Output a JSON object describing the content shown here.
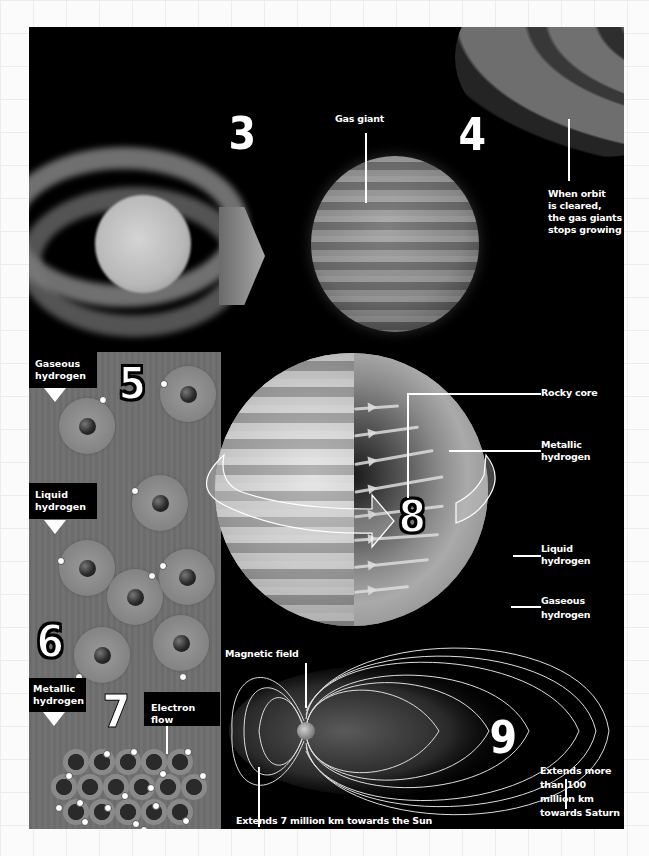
{
  "colors": {
    "panel_background": "#000000",
    "page_background": "#fbfbfb",
    "grid_line": "#ececec",
    "text": "#ffffff",
    "gray_panel": "#6f6f6f"
  },
  "stages": {
    "s3": {
      "number": "3"
    },
    "s4": {
      "number": "4",
      "gas_giant_label": "Gas giant",
      "orbit_note_lines": [
        "When orbit",
        "is cleared,",
        "the gas giants",
        "stops growing"
      ]
    },
    "s5": {
      "number": "5",
      "label_lines": [
        "Gaseous",
        "hydrogen"
      ]
    },
    "s6": {
      "number": "6",
      "label_lines": [
        "Liquid",
        "hydrogen"
      ]
    },
    "s7": {
      "number": "7",
      "label_lines": [
        "Metallic",
        "hydrogen"
      ],
      "electron_flow_label": "Electron flow"
    },
    "s8": {
      "number": "8",
      "layers": [
        {
          "label_lines": [
            "Rocky core"
          ]
        },
        {
          "label_lines": [
            "Metallic",
            "hydrogen"
          ]
        },
        {
          "label_lines": [
            "Liquid",
            "hydrogen"
          ]
        },
        {
          "label_lines": [
            "Gaseous",
            "hydrogen"
          ]
        }
      ]
    },
    "s9": {
      "number": "9",
      "magnetic_field_label": "Magnetic field",
      "sunward_note": "Extends 7 million km towards the Sun",
      "saturnward_note_lines": [
        "Extends more",
        "than 100",
        "million km",
        "towards Saturn"
      ]
    }
  }
}
